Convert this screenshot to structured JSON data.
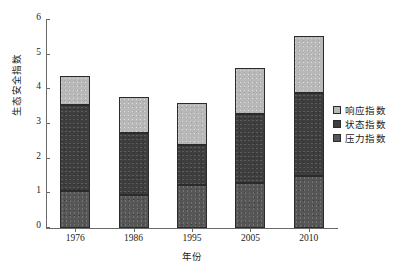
{
  "chart_data": {
    "type": "bar",
    "stacked": true,
    "title": "",
    "xlabel": "年份",
    "ylabel": "生态安全指数",
    "categories": [
      "1976",
      "1986",
      "1995",
      "2005",
      "2010"
    ],
    "ylim": [
      0,
      6
    ],
    "yticks": [
      "0",
      "1",
      "2",
      "3",
      "4",
      "5",
      "6"
    ],
    "grid": false,
    "legend_position": "right",
    "series": [
      {
        "name": "压力指数",
        "color": "#565656",
        "values": [
          1.07,
          0.95,
          1.24,
          1.31,
          1.5
        ]
      },
      {
        "name": "状态指数",
        "color": "#3e3e3e",
        "values": [
          2.49,
          1.78,
          1.16,
          1.99,
          2.4
        ]
      },
      {
        "name": "响应指数",
        "color": "#b8b8b8",
        "values": [
          0.82,
          1.04,
          1.2,
          1.31,
          1.64
        ]
      }
    ],
    "totals": [
      4.38,
      3.77,
      3.6,
      4.61,
      5.54
    ]
  },
  "legend": {
    "items": [
      {
        "label": "响应指数",
        "color": "#b8b8b8"
      },
      {
        "label": "状态指数",
        "color": "#3e3e3e"
      },
      {
        "label": "压力指数",
        "color": "#565656"
      }
    ]
  }
}
